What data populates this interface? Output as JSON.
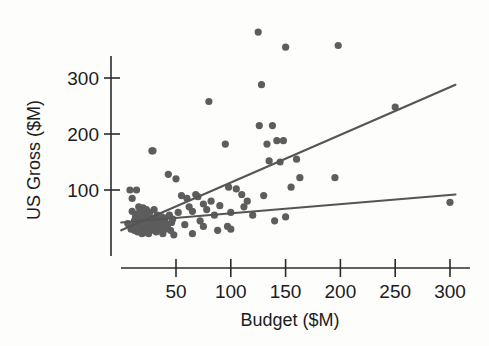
{
  "chart_data": {
    "type": "scatter",
    "title": "",
    "subtitle": "",
    "xlabel": "Budget ($M)",
    "ylabel": "US Gross ($M)",
    "xlim": [
      0,
      310
    ],
    "ylim": [
      0,
      400
    ],
    "xticks": [
      50,
      100,
      150,
      200,
      250,
      300
    ],
    "xtick_labels": [
      "50",
      "100",
      "150",
      "200",
      "250",
      "300"
    ],
    "yticks": [
      100,
      200,
      300
    ],
    "ytick_labels": [
      "100",
      "200",
      "300"
    ],
    "grid": false,
    "legend": null,
    "point_color": "#5d5d5d",
    "line_color": "#555555",
    "axis_color": "#2b2b2b",
    "background_color": "#fdfdfc",
    "marker_size": 3.6,
    "annotations": [],
    "series": [
      {
        "name": "Films",
        "type": "scatter",
        "x": [
          6,
          8,
          9,
          10,
          10,
          11,
          12,
          12,
          13,
          14,
          14,
          15,
          15,
          16,
          16,
          17,
          17,
          18,
          18,
          18,
          19,
          19,
          20,
          20,
          20,
          21,
          21,
          22,
          22,
          22,
          23,
          23,
          24,
          24,
          25,
          25,
          25,
          26,
          26,
          27,
          27,
          28,
          28,
          29,
          29,
          30,
          30,
          30,
          31,
          32,
          32,
          33,
          34,
          34,
          35,
          35,
          36,
          36,
          37,
          38,
          38,
          39,
          40,
          40,
          41,
          42,
          43,
          44,
          45,
          46,
          47,
          48,
          50,
          52,
          55,
          58,
          60,
          62,
          65,
          65,
          68,
          70,
          72,
          75,
          75,
          78,
          80,
          82,
          85,
          88,
          90,
          95,
          97,
          98,
          100,
          100,
          105,
          110,
          112,
          115,
          120,
          125,
          126,
          128,
          130,
          133,
          135,
          138,
          140,
          142,
          145,
          148,
          150,
          150,
          155,
          160,
          163,
          195,
          198,
          250,
          300
        ],
        "y": [
          40,
          100,
          30,
          62,
          85,
          35,
          45,
          28,
          52,
          100,
          38,
          58,
          25,
          44,
          70,
          33,
          55,
          48,
          30,
          62,
          40,
          22,
          52,
          35,
          68,
          45,
          28,
          58,
          38,
          25,
          48,
          65,
          42,
          30,
          55,
          35,
          22,
          60,
          40,
          48,
          28,
          170,
          45,
          35,
          170,
          50,
          30,
          65,
          42,
          38,
          25,
          55,
          45,
          30,
          48,
          35,
          42,
          28,
          52,
          38,
          22,
          45,
          50,
          30,
          40,
          35,
          128,
          55,
          28,
          42,
          48,
          20,
          120,
          60,
          90,
          38,
          85,
          70,
          62,
          22,
          92,
          88,
          45,
          75,
          35,
          65,
          258,
          80,
          55,
          28,
          72,
          182,
          35,
          105,
          60,
          30,
          102,
          92,
          70,
          80,
          55,
          382,
          215,
          288,
          90,
          182,
          152,
          215,
          45,
          188,
          150,
          188,
          355,
          52,
          105,
          155,
          122,
          122,
          358,
          248,
          78
        ]
      }
    ],
    "fit_lines": [
      {
        "name": "steep-regression-line",
        "x1": 0,
        "y1": 28,
        "x2": 305,
        "y2": 288
      },
      {
        "name": "shallow-regression-line",
        "x1": 0,
        "y1": 42,
        "x2": 305,
        "y2": 92
      }
    ]
  },
  "axes": {
    "x_axis_name": "budget-axis",
    "y_axis_name": "us-gross-axis"
  }
}
